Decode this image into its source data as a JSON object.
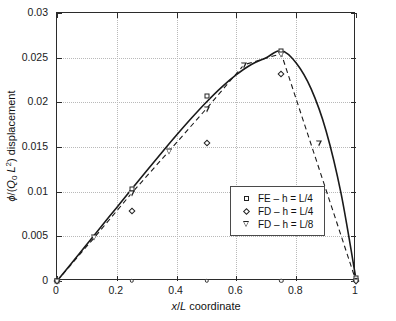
{
  "chart_data": {
    "type": "scatter",
    "title": "",
    "xlabel": "x/L coordinate",
    "ylabel": "ϕ/(Q₀ L²) displacement",
    "xlim": [
      0,
      1
    ],
    "ylim": [
      0,
      0.03
    ],
    "grid": true,
    "legend_position": "center",
    "xticks": [
      "0",
      "0.2",
      "0.4",
      "0.6",
      "0.8",
      "1"
    ],
    "xtick_values": [
      0,
      0.2,
      0.4,
      0.6,
      0.8,
      1
    ],
    "yticks": [
      "0",
      "0.005",
      "0.01",
      "0.015",
      "0.02",
      "0.025",
      "0.03"
    ],
    "ytick_values": [
      0,
      0.005,
      0.01,
      0.015,
      0.02,
      0.025,
      0.03
    ],
    "series": [
      {
        "name": "FE – h = L/4",
        "marker": "square",
        "x": [
          0,
          0.25,
          0.5,
          0.75,
          1
        ],
        "values": [
          0.0,
          0.0103,
          0.0207,
          0.0258,
          0.0003
        ]
      },
      {
        "name": "FD – h = L/4",
        "marker": "diamond",
        "x": [
          0,
          0.25,
          0.5,
          0.75,
          1
        ],
        "values": [
          0.0,
          0.0078,
          0.01545,
          0.0232,
          0.0
        ]
      },
      {
        "name": "FD – h = L/8",
        "marker": "triangle-down",
        "x": [
          0,
          0.125,
          0.25,
          0.375,
          0.5,
          0.625,
          0.75,
          0.875,
          1
        ],
        "values": [
          0.0,
          0.00487,
          0.00985,
          0.01455,
          0.0193,
          0.0242,
          0.02545,
          0.0155,
          0.0
        ]
      }
    ],
    "curves": [
      {
        "name": "exact-solid",
        "style": "solid",
        "x": [
          0,
          0.05,
          0.1,
          0.15,
          0.2,
          0.25,
          0.3,
          0.35,
          0.4,
          0.45,
          0.5,
          0.55,
          0.6,
          0.65,
          0.7,
          0.75,
          0.8,
          0.85,
          0.9,
          0.95,
          1.0
        ],
        "values": [
          0.0,
          0.00205,
          0.00412,
          0.00618,
          0.00824,
          0.0103,
          0.01234,
          0.01436,
          0.01634,
          0.01824,
          0.02004,
          0.02168,
          0.0231,
          0.02424,
          0.025,
          0.0258,
          0.0244,
          0.0215,
          0.0168,
          0.0098,
          0.0002
        ]
      },
      {
        "name": "fd-dashed",
        "style": "dashed",
        "x": [
          0,
          0.125,
          0.25,
          0.375,
          0.5,
          0.625,
          0.75,
          1.0
        ],
        "values": [
          0.0,
          0.00487,
          0.00985,
          0.01455,
          0.0193,
          0.0242,
          0.02545,
          0.0
        ]
      }
    ],
    "baseline_markers": {
      "marker": "circle",
      "x": [
        0,
        0.25,
        0.5,
        0.75,
        1
      ],
      "values": [
        0,
        0,
        0,
        0,
        0
      ]
    }
  },
  "legend": {
    "entries": [
      {
        "symbol": "square",
        "label": "FE – h = L/4"
      },
      {
        "symbol": "diamond",
        "label": "FD – h = L/4"
      },
      {
        "symbol": "triangle-down",
        "label": "FD – h = L/8"
      }
    ]
  },
  "colors": {
    "axis": "#2b2b2b",
    "grid": "#b9b9b9",
    "curve": "#1a1a1a",
    "background": "#ffffff"
  }
}
